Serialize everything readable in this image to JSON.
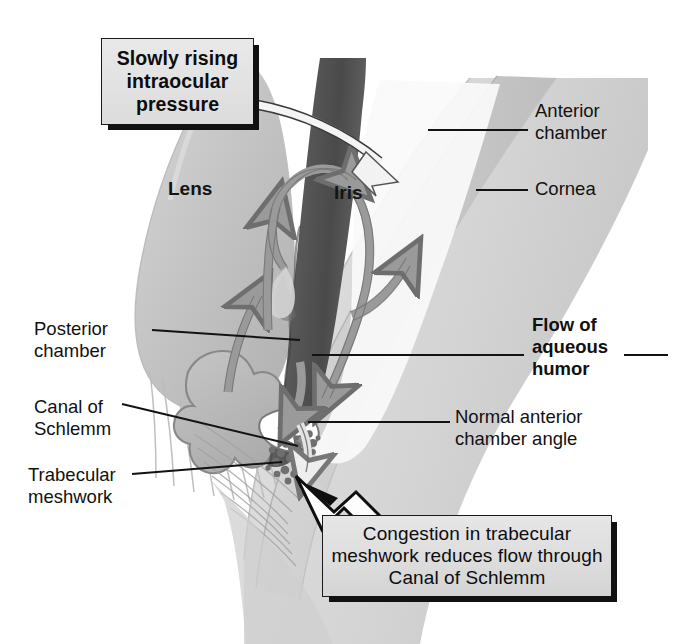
{
  "figure": {
    "width": 684,
    "height": 644,
    "background": "#ffffff"
  },
  "callouts": [
    {
      "id": "pressure",
      "text": "Slowly rising\nintraocular\npressure",
      "bold": true,
      "box_fill": "#e4e4e4",
      "border": "#1a1a1a",
      "shadow": "#111111"
    },
    {
      "id": "congestion",
      "text": "Congestion in trabecular\nmeshwork reduces flow\nthrough Canal of Schlemm",
      "bold": false,
      "box_fill": "#dedede",
      "border": "#1a1a1a",
      "shadow": "#111111"
    }
  ],
  "labels": {
    "anterior_chamber": "Anterior\nchamber",
    "cornea": "Cornea",
    "flow_of_aqueous_humor": "Flow of\naqueous\nhumor",
    "normal_anterior_chamber_angle": "Normal anterior\nchamber angle",
    "posterior_chamber": "Posterior\nchamber",
    "canal_of_schlemm": "Canal of\nSchlemm",
    "trabecular_meshwork": "Trabecular\nmeshwork",
    "lens": "Lens",
    "iris": "Iris"
  },
  "colors": {
    "sclera": "#d8d8d8",
    "cornea_band": "#cfcfcf",
    "lens": "#bfbfbf",
    "iris_dark": "#5a5a5a",
    "ciliary_body": "#b9b9b9",
    "arrow_gray": "#9a9a9a",
    "arrow_outline": "#6e6e6e",
    "leader_line": "#1a1a1a",
    "text": "#111111",
    "congestion_stipple": "#6b6b6b",
    "white_arrow_fill": "#f2f2f2"
  },
  "structures": [
    "lens",
    "zonular-fibers",
    "ciliary-body",
    "iris",
    "cornea",
    "sclera",
    "anterior-chamber",
    "posterior-chamber",
    "canal-of-schlemm",
    "trabecular-meshwork",
    "congestion-cluster"
  ],
  "flow_arrows": [
    {
      "name": "posterior-chamber-upflow",
      "direction": "up"
    },
    {
      "name": "pupil-loop-over-iris",
      "direction": "up-right"
    },
    {
      "name": "anterior-chamber-downflow",
      "direction": "down"
    },
    {
      "name": "anterior-chamber-outflow",
      "direction": "up-right"
    },
    {
      "name": "angle-inflow",
      "direction": "down-right"
    },
    {
      "name": "outflow-to-meshwork",
      "direction": "down"
    },
    {
      "name": "pressure-callout-arrow",
      "direction": "down-right"
    },
    {
      "name": "congestion-callout-arrow",
      "direction": "up-left"
    }
  ]
}
